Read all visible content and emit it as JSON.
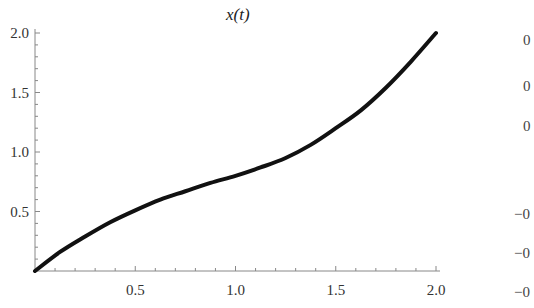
{
  "chart_data": {
    "type": "line",
    "title": "x(t)",
    "xlabel": "",
    "ylabel": "",
    "xlim": [
      0,
      2.0
    ],
    "ylim": [
      0,
      2.0
    ],
    "grid": false,
    "legend": null,
    "x_ticks": [
      "0.5",
      "1.0",
      "1.5",
      "2.0"
    ],
    "y_ticks": [
      "0.5",
      "1.0",
      "1.5",
      "2.0"
    ],
    "series": [
      {
        "name": "x(t)",
        "color": "#111111",
        "x": [
          0,
          0.125,
          0.25,
          0.375,
          0.5,
          0.625,
          0.75,
          0.875,
          1.0,
          1.125,
          1.25,
          1.375,
          1.5,
          1.625,
          1.75,
          1.875,
          2.0
        ],
        "y": [
          0,
          0.16,
          0.29,
          0.41,
          0.51,
          0.6,
          0.67,
          0.74,
          0.8,
          0.87,
          0.95,
          1.06,
          1.2,
          1.35,
          1.54,
          1.76,
          2.0
        ]
      }
    ]
  },
  "partial_right_chart": {
    "visible_tick_fragments": [
      "0",
      "0",
      "0",
      "−0",
      "−0",
      "−0"
    ]
  }
}
